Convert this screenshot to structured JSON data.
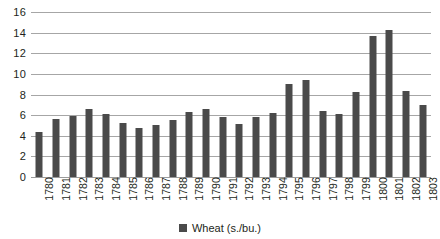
{
  "chart_data": {
    "type": "bar",
    "title": "",
    "xlabel": "",
    "ylabel": "",
    "ylim": [
      0,
      16
    ],
    "ytick_step": 2,
    "yticks": [
      "16",
      "14",
      "12",
      "10",
      "8",
      "6",
      "4",
      "2",
      "0"
    ],
    "grid": true,
    "legend_position": "bottom",
    "series_color": "#4a4a4a",
    "categories": [
      "1780",
      "1781",
      "1782",
      "1783",
      "1784",
      "1785",
      "1786",
      "1787",
      "1788",
      "1789",
      "1790",
      "1791",
      "1792",
      "1793",
      "1794",
      "1795",
      "1796",
      "1797",
      "1798",
      "1799",
      "1800",
      "1801",
      "1802",
      "1803"
    ],
    "series": [
      {
        "name": "Wheat (s./bu.)",
        "values": [
          4.4,
          5.6,
          5.95,
          6.55,
          6.1,
          5.2,
          4.75,
          5.05,
          5.5,
          6.35,
          6.55,
          5.8,
          5.1,
          5.85,
          6.25,
          9.0,
          9.4,
          6.4,
          6.15,
          8.25,
          13.65,
          14.3,
          8.3,
          7.0
        ]
      }
    ]
  },
  "legend": {
    "label": "Wheat (s./bu.)"
  }
}
